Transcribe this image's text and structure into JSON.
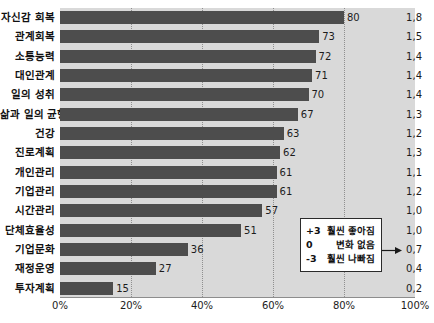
{
  "chart_data": {
    "type": "bar",
    "orientation": "horizontal",
    "title": "",
    "xlabel": "",
    "ylabel": "",
    "xlim": [
      0,
      100
    ],
    "grid": true,
    "grid_axis": "x",
    "x_ticks": [
      "0%",
      "20%",
      "40%",
      "60%",
      "80%",
      "100%"
    ],
    "x_tick_values": [
      0,
      20,
      40,
      60,
      80,
      100
    ],
    "categories": [
      "자신감 회복",
      "관계회복",
      "소통능력",
      "대인관계",
      "일의 성취",
      "삶과 일의 균형",
      "건강",
      "진로계획",
      "개인관리",
      "기업관리",
      "시간관리",
      "단체효율성",
      "기업문화",
      "재정운영",
      "투자계획"
    ],
    "values": [
      80,
      73,
      72,
      71,
      70,
      67,
      63,
      62,
      61,
      61,
      57,
      51,
      36,
      27,
      15
    ],
    "value_labels": [
      "80",
      "73",
      "72",
      "71",
      "70",
      "67",
      "63",
      "62",
      "61",
      "61",
      "57",
      "51",
      "36",
      "27",
      "15"
    ],
    "secondary_column": {
      "name": "평균 변화 점수",
      "labels": [
        "1,8",
        "1,5",
        "1,4",
        "1,4",
        "1,4",
        "1,3",
        "1,2",
        "1,3",
        "1,1",
        "1,2",
        "1,0",
        "1,0",
        "0,7",
        "0,4",
        "0,2"
      ],
      "values": [
        1.8,
        1.5,
        1.4,
        1.4,
        1.4,
        1.3,
        1.2,
        1.3,
        1.1,
        1.2,
        1.0,
        1.0,
        0.7,
        0.4,
        0.2
      ]
    },
    "annotation": {
      "points_to": "0,7",
      "rows": [
        {
          "score": "+3",
          "text": "훨씬 좋아짐"
        },
        {
          "score": "0",
          "text": "변화 없음"
        },
        {
          "score": "-3",
          "text": "훨씬 나빠짐"
        }
      ]
    },
    "colors": {
      "bar": "#4d4d4d",
      "plot_background": "#d9d9d9",
      "page_background": "#ffffff",
      "gridline": "#8f8f8f",
      "text": "#1c1c1c"
    }
  },
  "top_sliver_text": ""
}
